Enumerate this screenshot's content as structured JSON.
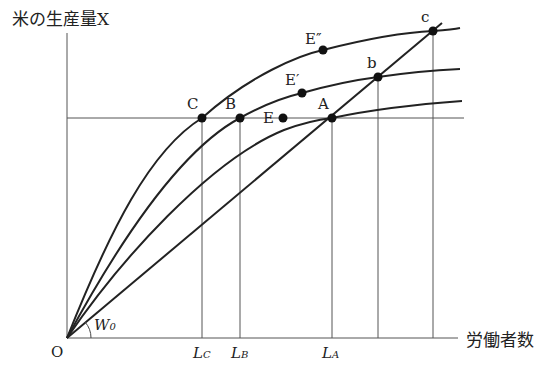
{
  "diagram": {
    "y_axis_label": "米の生産量X",
    "x_axis_label": "労働者数",
    "origin_label": "O",
    "angle_label": {
      "main": "W",
      "sub": "0"
    },
    "points": {
      "C": "C",
      "B": "B",
      "E": "E",
      "A": "A",
      "E_prime": "E′",
      "E_dprime": "E″",
      "b": "b",
      "c": "c"
    },
    "x_ticks": [
      {
        "main": "L",
        "sub": "C"
      },
      {
        "main": "L",
        "sub": "B"
      },
      {
        "main": "L",
        "sub": "A"
      }
    ],
    "colors": {
      "line": "#222222",
      "grid": "#555555"
    }
  }
}
